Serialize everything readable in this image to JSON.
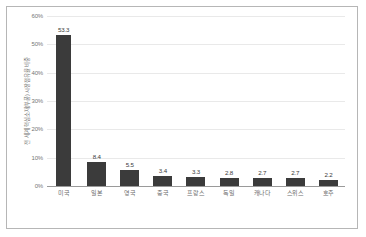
{
  "chart_data": {
    "type": "bar",
    "title": "",
    "xlabel": "",
    "ylabel": "전 세계 핵심소재(부품) 시장점유율 비중",
    "categories": [
      "미국",
      "일본",
      "영국",
      "중국",
      "프랑스",
      "독일",
      "캐나다",
      "스위스",
      "호주"
    ],
    "values": [
      53.3,
      8.4,
      5.5,
      3.4,
      3.3,
      2.8,
      2.7,
      2.7,
      2.2
    ],
    "data_labels": [
      "53.3",
      "8.4",
      "5.5",
      "3.4",
      "3.3",
      "2.8",
      "2.7",
      "2.7",
      "2.2"
    ],
    "ylim": [
      0,
      60
    ],
    "ytick_values": [
      0,
      10,
      20,
      30,
      40,
      50,
      60
    ],
    "ytick_labels": [
      "0%",
      "10%",
      "20%",
      "30%",
      "40%",
      "50%",
      "60%"
    ],
    "grid": true,
    "legend": false,
    "bar_color": "#3b3b3b",
    "gridline_color": "#e9e9e9",
    "axis_color": "#9a9a9a",
    "frame_color": "#b6b6b6",
    "tick_label_color": "#767676"
  }
}
